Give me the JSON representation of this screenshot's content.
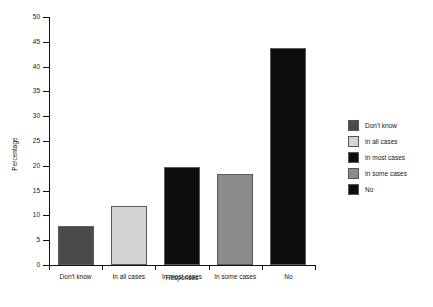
{
  "chart_data": {
    "type": "bar",
    "title": "",
    "xlabel": "Responses",
    "ylabel": "Percentage",
    "categories": [
      "Don't know",
      "In all cases",
      "In most cases",
      "In some cases",
      "No"
    ],
    "values": [
      7.8,
      11.8,
      19.8,
      18.4,
      43.7
    ],
    "ylim": [
      0,
      50
    ],
    "yticks": [
      0,
      5,
      10,
      15,
      20,
      25,
      30,
      35,
      40,
      45,
      50
    ],
    "ytick_labels": [
      "0",
      "5",
      "10",
      "15",
      "20",
      "25",
      "30",
      "35",
      "40",
      "45",
      "50"
    ],
    "grid": false,
    "legend_position": "right",
    "series": [
      {
        "name": "Percentage",
        "points": [
          {
            "category": "Don't know",
            "value": 7.8,
            "color": "#4a4a4a"
          },
          {
            "category": "In all cases",
            "value": 11.8,
            "color": "#d4d4d4"
          },
          {
            "category": "In most cases",
            "value": 19.8,
            "color": "#0d0d0d"
          },
          {
            "category": "In some cases",
            "value": 18.4,
            "color": "#8c8c8c"
          },
          {
            "category": "No",
            "value": 43.7,
            "color": "#0d0d0d"
          }
        ]
      }
    ],
    "legend": [
      {
        "label": "Don't know",
        "color": "#4a4a4a"
      },
      {
        "label": "In all cases",
        "color": "#d4d4d4"
      },
      {
        "label": "In most cases",
        "color": "#0d0d0d"
      },
      {
        "label": "In some cases",
        "color": "#8c8c8c"
      },
      {
        "label": "No",
        "color": "#0d0d0d"
      }
    ]
  }
}
